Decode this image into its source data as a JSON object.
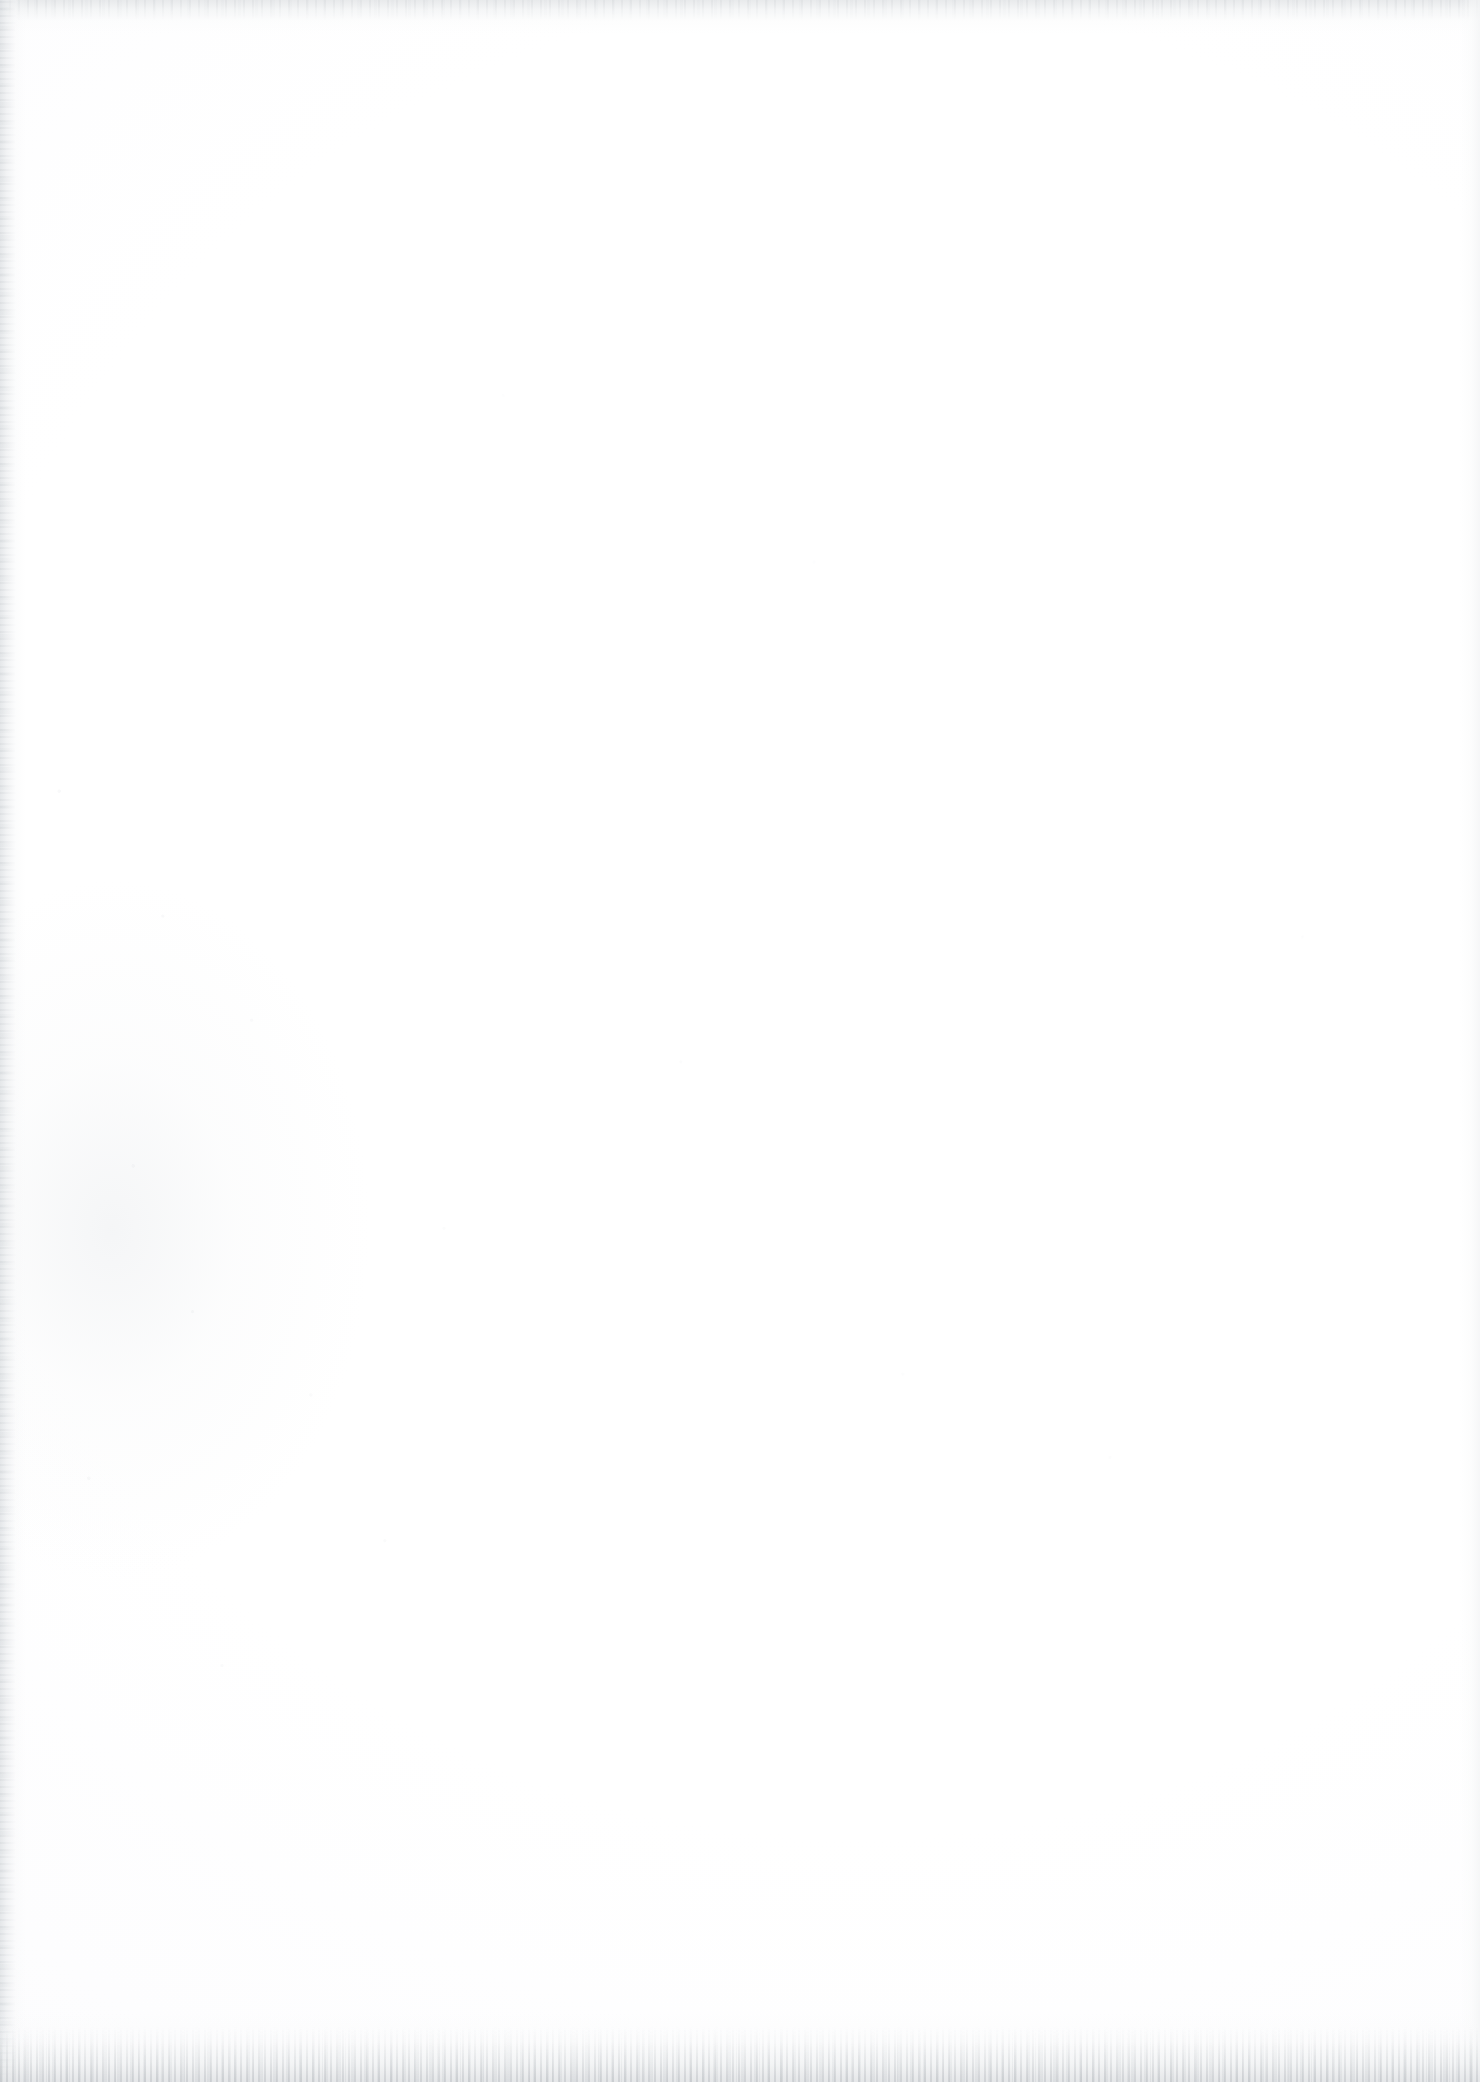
{
  "document": {
    "kind": "scanned-page",
    "orientation": "portrait",
    "page_width_px": 1480,
    "page_height_px": 2082,
    "content_text": "",
    "has_text": false,
    "has_figures": false,
    "has_tables": false,
    "description": "Blank scanned sheet of paper with no printed or handwritten content."
  },
  "colors": {
    "paper": "#FFFFFF",
    "paper_tint": "#FDFDFE",
    "edge_gray": "#E4E6E8",
    "speck_gray": "#B0B4B9",
    "bottom_band": "#E2E4E6"
  },
  "artifacts": {
    "top_edge": "light-gray scanner lead-in band",
    "left_edge": "faint vertical gray streak",
    "right_edge": "very faint vertical streak",
    "bottom_edge": "speckled gray grain band",
    "dust": "scattered dust specks, densest in the lower-left quadrant"
  }
}
